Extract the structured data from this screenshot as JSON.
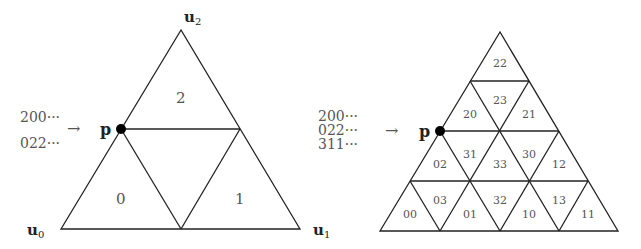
{
  "left_diagram": {
    "vertices": {
      "top": "u",
      "top_sub": "2",
      "left": "u",
      "left_sub": "0",
      "right": "u",
      "right_sub": "1"
    },
    "point_label": "p",
    "codes": [
      "200···",
      "022···"
    ],
    "arrow": "→",
    "regions": {
      "top": "2",
      "left": "0",
      "right": "1"
    }
  },
  "right_diagram": {
    "point_label": "p",
    "codes": [
      "200···",
      "022···",
      "311···"
    ],
    "arrow": "→",
    "regions": {
      "r22": "22",
      "r20": "20",
      "r23": "23",
      "r21": "21",
      "r02": "02",
      "r31": "31",
      "r33": "33",
      "r30": "30",
      "r12": "12",
      "r00": "00",
      "r03": "03",
      "r01": "01",
      "r32": "32",
      "r10": "10",
      "r13": "13",
      "r11": "11"
    }
  }
}
